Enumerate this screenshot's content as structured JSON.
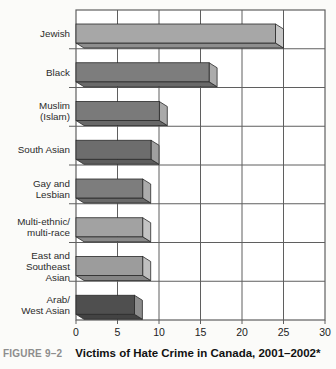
{
  "figure": {
    "label": "FIGURE 9–2",
    "title": "Victims of Hate Crime in Canada, 2001–2002*"
  },
  "chart_data": {
    "type": "bar",
    "orientation": "horizontal",
    "title": "Victims of Hate Crime in Canada, 2001–2002*",
    "categories": [
      "Jewish",
      "Black",
      "Muslim\n(Islam)",
      "South Asian",
      "Gay and\nLesbian",
      "Multi-ethnic/\nmulti-race",
      "East and\nSoutheast\nAsian",
      "Arab/\nWest Asian"
    ],
    "values": [
      25,
      17,
      11,
      10,
      9,
      9,
      9,
      8
    ],
    "xlabel": "",
    "ylabel": "",
    "xlim": [
      0,
      30
    ],
    "xticks": [
      0,
      5,
      10,
      15,
      20,
      25,
      30
    ],
    "grid": true,
    "legend": "none",
    "effect": "3d",
    "bar_colors": [
      "#a7a7a7",
      "#7d7d7d",
      "#7a7a7a",
      "#6d6d6d",
      "#7d7d7d",
      "#a2a2a2",
      "#9c9c9c",
      "#4f4f4f"
    ],
    "grid_color": "#5f5f5f",
    "outline_color": "#2a2a2a",
    "plot_background": "#ffffff"
  }
}
